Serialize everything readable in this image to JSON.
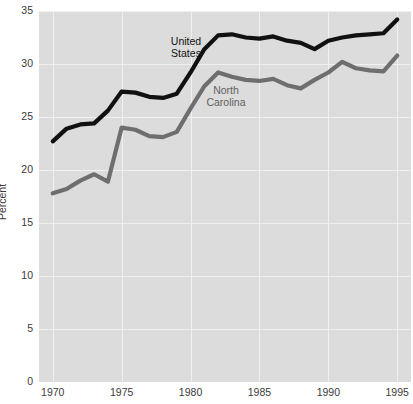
{
  "chart_data": {
    "type": "line",
    "title": "",
    "xlabel": "",
    "ylabel": "Percent",
    "xlim": [
      1969,
      1996
    ],
    "ylim": [
      0,
      35
    ],
    "xticks": [
      "1970",
      "1975",
      "1980",
      "1985",
      "1990",
      "1995"
    ],
    "yticks": [
      "0",
      "5",
      "10",
      "15",
      "20",
      "25",
      "30",
      "35"
    ],
    "grid": true,
    "legend_position": "inline-annotations",
    "x": [
      1970,
      1971,
      1972,
      1973,
      1974,
      1975,
      1976,
      1977,
      1978,
      1979,
      1980,
      1981,
      1982,
      1983,
      1984,
      1985,
      1986,
      1987,
      1988,
      1989,
      1990,
      1991,
      1992,
      1993,
      1994,
      1995
    ],
    "series": [
      {
        "name": "United States",
        "color": "#111111",
        "values": [
          22.7,
          23.9,
          24.3,
          24.4,
          25.6,
          27.4,
          27.3,
          26.9,
          26.8,
          27.2,
          29.2,
          31.4,
          32.7,
          32.8,
          32.5,
          32.4,
          32.6,
          32.2,
          32.0,
          31.4,
          32.2,
          32.5,
          32.7,
          32.8,
          32.9,
          34.2
        ]
      },
      {
        "name": "North Carolina",
        "color": "#6e6e6e",
        "values": [
          17.8,
          18.2,
          19.0,
          19.6,
          18.9,
          24.0,
          23.8,
          23.2,
          23.1,
          23.6,
          25.8,
          27.9,
          29.2,
          28.8,
          28.5,
          28.4,
          28.6,
          28.0,
          27.7,
          28.5,
          29.2,
          30.2,
          29.6,
          29.4,
          29.3,
          30.8
        ]
      }
    ]
  },
  "axis": {
    "y_title": "Percent",
    "x_ticks": [
      "1970",
      "1975",
      "1980",
      "1985",
      "1990",
      "1995"
    ],
    "y_ticks": [
      "0",
      "5",
      "10",
      "15",
      "20",
      "25",
      "30",
      "35"
    ]
  },
  "annotations": {
    "us_label": "United\nStates",
    "nc_label": "North\nCarolina"
  },
  "colors": {
    "plot_background": "#dcdcdc",
    "gridline": "#f0f0f0",
    "us_line": "#111111",
    "nc_line": "#6e6e6e",
    "tick_text": "#3a3a3a"
  }
}
